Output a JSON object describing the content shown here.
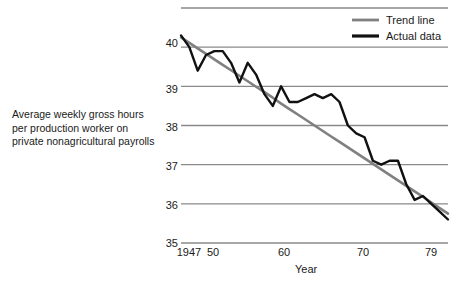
{
  "caption": {
    "lines": [
      "Average weekly gross hours",
      "per production worker on",
      "private nonagricultural payrolls"
    ]
  },
  "axes": {
    "x_title": "Year",
    "y_ticks": [
      "35",
      "36",
      "37",
      "38",
      "39",
      "40"
    ],
    "x_ticks": [
      "1947",
      "50",
      "60",
      "70",
      "79"
    ]
  },
  "legend": {
    "trend_label": "Trend line",
    "actual_label": "Actual data"
  },
  "colors": {
    "trend": "#808080",
    "actual": "#111111",
    "gridline": "#8a8a8a",
    "background": "#ffffff",
    "text": "#1a1a1a"
  },
  "chart_data": {
    "type": "line",
    "title": "",
    "xlabel": "Year",
    "ylabel": "Average weekly gross hours per production worker on private nonagricultural payrolls",
    "xlim": [
      1947,
      1979
    ],
    "ylim": [
      35,
      41
    ],
    "grid": true,
    "grid_values": [
      35,
      36,
      37,
      38,
      39,
      40,
      41
    ],
    "ytick_labels": [
      "35",
      "36",
      "37",
      "38",
      "39",
      "40"
    ],
    "xtick_values": [
      1947,
      1950,
      1960,
      1970,
      1979
    ],
    "xtick_labels": [
      "1947",
      "50",
      "60",
      "70",
      "79"
    ],
    "legend_position": "top-right",
    "x": [
      1947,
      1948,
      1949,
      1950,
      1951,
      1952,
      1953,
      1954,
      1955,
      1956,
      1957,
      1958,
      1959,
      1960,
      1961,
      1962,
      1963,
      1964,
      1965,
      1966,
      1967,
      1968,
      1969,
      1970,
      1971,
      1972,
      1973,
      1974,
      1975,
      1976,
      1977,
      1978,
      1979
    ],
    "series": [
      {
        "name": "Actual data",
        "color": "#111111",
        "values": [
          40.3,
          40.0,
          39.4,
          39.8,
          39.9,
          39.9,
          39.6,
          39.1,
          39.6,
          39.3,
          38.8,
          38.5,
          39.0,
          38.6,
          38.6,
          38.7,
          38.8,
          38.7,
          38.8,
          38.6,
          38.0,
          37.8,
          37.7,
          37.1,
          37.0,
          37.1,
          37.1,
          36.5,
          36.1,
          36.2,
          36.0,
          35.8,
          35.6
        ]
      },
      {
        "name": "Trend line",
        "color": "#808080",
        "values": [
          40.25,
          40.11,
          39.97,
          39.83,
          39.69,
          39.55,
          39.41,
          39.27,
          39.13,
          38.99,
          38.85,
          38.71,
          38.56,
          38.42,
          38.28,
          38.14,
          38.0,
          37.86,
          37.72,
          37.58,
          37.44,
          37.3,
          37.16,
          37.02,
          36.88,
          36.74,
          36.6,
          36.46,
          36.32,
          36.18,
          36.03,
          35.89,
          35.75
        ]
      }
    ]
  }
}
